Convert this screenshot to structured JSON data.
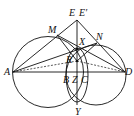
{
  "diagram": {
    "labels": {
      "E": "E",
      "Ep": "E′",
      "M": "M",
      "N": "N",
      "X": "X",
      "R": "R",
      "A": "A",
      "B": "B",
      "Z": "Z",
      "C": "C",
      "D": "D",
      "Y": "Y"
    }
  }
}
